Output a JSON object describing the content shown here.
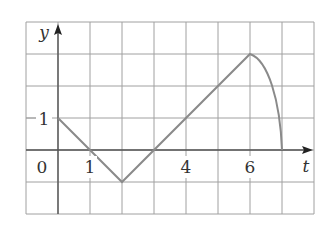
{
  "chart_data": {
    "type": "line",
    "title": "",
    "xlabel": "t",
    "ylabel": "y",
    "xlim": [
      -1,
      8
    ],
    "ylim": [
      -2,
      4
    ],
    "grid": true,
    "tick_labels": {
      "x": [
        "0",
        "1",
        "4",
        "6"
      ],
      "y": [
        "1"
      ]
    },
    "series": [
      {
        "name": "y(t)",
        "segments": [
          {
            "kind": "line",
            "points": [
              [
                0,
                1
              ],
              [
                2,
                -1
              ]
            ]
          },
          {
            "kind": "line",
            "points": [
              [
                2,
                -1
              ],
              [
                6,
                3
              ]
            ]
          },
          {
            "kind": "curve",
            "description": "concave-down arc from peak to t-axis",
            "points": [
              [
                6,
                3
              ],
              [
                6.5,
                2.2
              ],
              [
                6.9,
                1.0
              ],
              [
                7,
                0
              ]
            ]
          }
        ],
        "x": [
          0,
          2,
          6,
          7
        ],
        "values": [
          1,
          -1,
          3,
          0
        ]
      }
    ],
    "colors": {
      "curve": "#8a8a8a",
      "grid": "#a0a0a0",
      "axis": "#555555"
    }
  },
  "labels": {
    "y_axis": "y",
    "t_axis": "t",
    "origin": "0",
    "x_tick_1": "1",
    "x_tick_4": "4",
    "x_tick_6": "6",
    "y_tick_1": "1"
  }
}
